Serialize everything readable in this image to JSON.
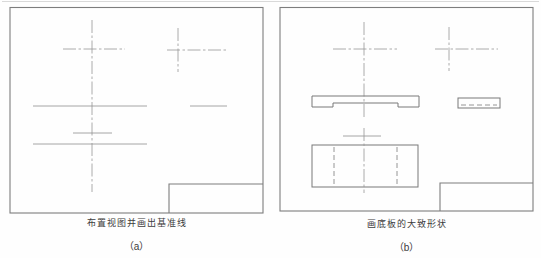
{
  "figure": {
    "background_color": "#fefefe",
    "text_color": "#3c3c3c",
    "panels": [
      {
        "id": "a",
        "caption": "布置视图并画出基准线",
        "label": "（a）"
      },
      {
        "id": "b",
        "caption": "画底板的大致形状",
        "label": "（b）"
      }
    ],
    "stroke_styles": {
      "frame": {
        "color": "#7d7d7d",
        "width": 1.1,
        "dash": ""
      },
      "solid": {
        "color": "#787878",
        "width": 1,
        "dash": ""
      },
      "thin": {
        "color": "#8f8f8f",
        "width": 0.8,
        "dash": ""
      },
      "centerline": {
        "color": "#979797",
        "width": 0.8,
        "dash": "13 2.5 2.5 2.5"
      },
      "dashed": {
        "color": "#8a8a8a",
        "width": 0.9,
        "dash": "5 3"
      },
      "faint": {
        "color": "#d9d9d9",
        "width": 1,
        "dash": ""
      }
    },
    "strokes": [
      {
        "name": "page-top-edge",
        "kind": "line",
        "x1": 2,
        "y1": 1.5,
        "x2": 539,
        "y2": 1.5,
        "style": "faint"
      },
      {
        "name": "panel-a-border",
        "kind": "rect",
        "x": 10,
        "y": 7.5,
        "w": 253,
        "h": 205.5,
        "style": "frame"
      },
      {
        "name": "panel-a-titleblock",
        "kind": "path",
        "d": "M169,213 L169,184 L263,184",
        "style": "frame"
      },
      {
        "name": "panel-a-center-vertical",
        "kind": "line",
        "x1": 92,
        "y1": 20,
        "x2": 92,
        "y2": 192,
        "style": "centerline"
      },
      {
        "name": "panel-a-center-horizontal",
        "kind": "line",
        "x1": 63,
        "y1": 49,
        "x2": 125,
        "y2": 49,
        "style": "centerline"
      },
      {
        "name": "panel-a-topright-vertical",
        "kind": "line",
        "x1": 178,
        "y1": 28,
        "x2": 178,
        "y2": 72,
        "style": "centerline"
      },
      {
        "name": "panel-a-topright-horizontal",
        "kind": "line",
        "x1": 167,
        "y1": 50,
        "x2": 227,
        "y2": 50,
        "style": "centerline"
      },
      {
        "name": "panel-a-datum-line-1",
        "kind": "line",
        "x1": 33,
        "y1": 106,
        "x2": 147,
        "y2": 106,
        "style": "thin"
      },
      {
        "name": "panel-a-datum-line-1-right",
        "kind": "line",
        "x1": 190,
        "y1": 106,
        "x2": 227,
        "y2": 106,
        "style": "thin"
      },
      {
        "name": "panel-a-datum-line-2",
        "kind": "line",
        "x1": 73,
        "y1": 133,
        "x2": 112,
        "y2": 133,
        "style": "thin"
      },
      {
        "name": "panel-a-datum-line-3",
        "kind": "line",
        "x1": 33,
        "y1": 144,
        "x2": 147,
        "y2": 144,
        "style": "thin"
      },
      {
        "name": "panel-b-border",
        "kind": "rect",
        "x": 280,
        "y": 7.5,
        "w": 253,
        "h": 203.5,
        "style": "frame"
      },
      {
        "name": "panel-b-titleblock",
        "kind": "path",
        "d": "M440,211 L440,183 L533,183",
        "style": "frame"
      },
      {
        "name": "panel-b-center-vertical",
        "kind": "line",
        "x1": 364,
        "y1": 22,
        "x2": 364,
        "y2": 119,
        "style": "centerline"
      },
      {
        "name": "panel-b-center-horizontal",
        "kind": "line",
        "x1": 333,
        "y1": 49,
        "x2": 397,
        "y2": 49,
        "style": "centerline"
      },
      {
        "name": "panel-b-topright-vertical",
        "kind": "line",
        "x1": 449,
        "y1": 27,
        "x2": 449,
        "y2": 71,
        "style": "centerline"
      },
      {
        "name": "panel-b-topright-horizontal",
        "kind": "line",
        "x1": 435,
        "y1": 49,
        "x2": 498,
        "y2": 49,
        "style": "centerline"
      },
      {
        "name": "panel-b-baseplate-front-view",
        "kind": "path",
        "d": "M312,96 L419,96 L419,107 L398,107 L398,103 L333,103 L333,107 L312,107 Z",
        "style": "solid"
      },
      {
        "name": "panel-b-side-view",
        "kind": "rect",
        "x": 458,
        "y": 98,
        "w": 42,
        "h": 10,
        "style": "solid"
      },
      {
        "name": "panel-b-side-view-hidden-line",
        "kind": "line",
        "x1": 461,
        "y1": 105,
        "x2": 497,
        "y2": 105,
        "style": "dashed"
      },
      {
        "name": "panel-b-small-cross-horizontal",
        "kind": "line",
        "x1": 343,
        "y1": 136,
        "x2": 381,
        "y2": 136,
        "style": "thin"
      },
      {
        "name": "panel-b-top-view",
        "kind": "rect",
        "x": 312,
        "y": 145,
        "w": 106,
        "h": 42,
        "style": "solid"
      },
      {
        "name": "panel-b-top-view-hidden-left",
        "kind": "line",
        "x1": 334,
        "y1": 147,
        "x2": 334,
        "y2": 185,
        "style": "dashed"
      },
      {
        "name": "panel-b-top-view-hidden-right",
        "kind": "line",
        "x1": 397,
        "y1": 147,
        "x2": 397,
        "y2": 185,
        "style": "dashed"
      },
      {
        "name": "panel-b-bottom-center-vertical",
        "kind": "line",
        "x1": 364,
        "y1": 128,
        "x2": 364,
        "y2": 193,
        "style": "centerline"
      }
    ]
  }
}
